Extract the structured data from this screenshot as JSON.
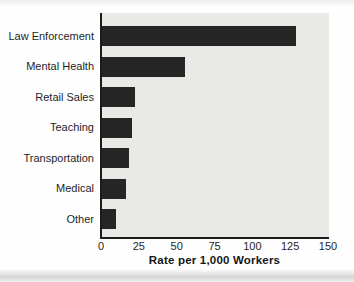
{
  "chart_data": {
    "type": "bar",
    "orientation": "horizontal",
    "title": "",
    "categories": [
      "Law Enforcement",
      "Mental Health",
      "Retail Sales",
      "Teaching",
      "Transportation",
      "Medical",
      "Other"
    ],
    "values": [
      128,
      55,
      22,
      20,
      18,
      16,
      9
    ],
    "xlabel": "Rate per 1,000 Workers",
    "ylabel": "",
    "xticks": [
      0,
      25,
      50,
      75,
      100,
      125,
      150
    ],
    "xlim": [
      0,
      150
    ],
    "grid": false,
    "legend_position": "none",
    "bar_color": "#262626",
    "plot_background": "#e9e9e6",
    "axis_color": "#1b1b1b"
  }
}
